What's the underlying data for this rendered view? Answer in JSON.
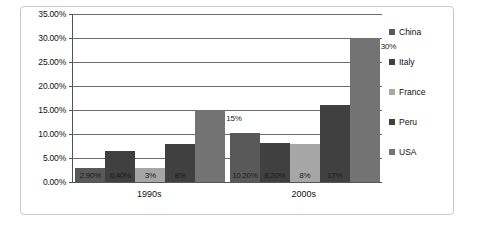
{
  "chart_data": {
    "type": "bar",
    "title": "",
    "xlabel": "",
    "ylabel": "",
    "categories": [
      "1990s",
      "2000s"
    ],
    "series": [
      {
        "name": "China",
        "color": "#595959",
        "values": [
          2.9,
          10.2
        ],
        "labels": [
          "2.90%",
          "10.20%"
        ]
      },
      {
        "name": "Italy",
        "color": "#404040",
        "values": [
          6.4,
          8.2
        ],
        "labels": [
          "6.40%",
          "8.20%"
        ]
      },
      {
        "name": "France",
        "color": "#a6a6a6",
        "values": [
          3.0,
          8.0
        ],
        "labels": [
          "3%",
          "8%"
        ]
      },
      {
        "name": "Peru",
        "color": "#404040",
        "values": [
          8.0,
          16.0
        ],
        "labels": [
          "8%",
          "17%"
        ]
      },
      {
        "name": "USA",
        "color": "#737373",
        "values": [
          15.0,
          30.0
        ],
        "labels": [
          "15%",
          "30%"
        ]
      }
    ],
    "ylim": [
      0,
      35
    ],
    "yticks": [
      "0.00%",
      "5.00%",
      "10.00%",
      "15.00%",
      "20.00%",
      "25.00%",
      "30.00%",
      "35.00%"
    ],
    "ytick_values": [
      0,
      5,
      10,
      15,
      20,
      25,
      30,
      35
    ],
    "grid": true,
    "legend_position": "right"
  }
}
